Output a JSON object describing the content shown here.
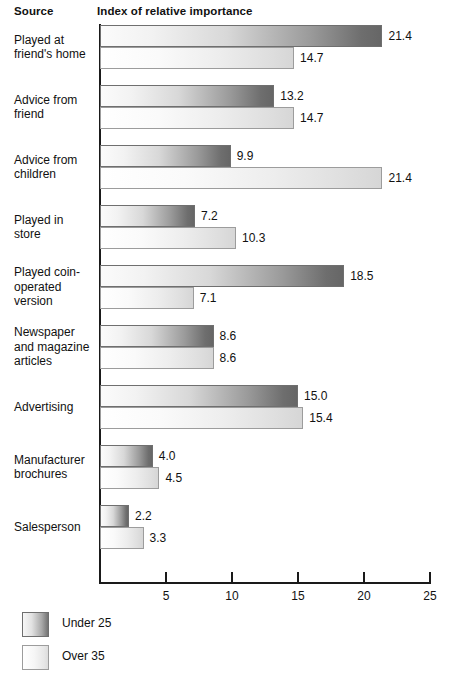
{
  "headers": {
    "source": "Source",
    "index": "Index of relative importance"
  },
  "axis": {
    "ticks": [
      {
        "value": 5,
        "label": "5"
      },
      {
        "value": 10,
        "label": "10"
      },
      {
        "value": 15,
        "label": "15"
      },
      {
        "value": 20,
        "label": "20"
      },
      {
        "value": 25,
        "label": "25"
      }
    ]
  },
  "legend": [
    {
      "name": "under25",
      "label": "Under 25"
    },
    {
      "name": "over35",
      "label": "Over 35"
    }
  ],
  "chart_data": {
    "type": "bar",
    "orientation": "horizontal",
    "title": "Index of relative importance",
    "xlabel": "",
    "ylabel": "Source",
    "xlim": [
      0,
      25
    ],
    "grid": false,
    "legend_position": "bottom-left",
    "categories": [
      "Played at friend's home",
      "Advice from friend",
      "Advice from children",
      "Played in store",
      "Played coin-operated version",
      "Newspaper and magazine articles",
      "Advertising",
      "Manufacturer brochures",
      "Salesperson"
    ],
    "category_lines": [
      [
        "Played at",
        "friend's home"
      ],
      [
        "Advice from",
        "friend"
      ],
      [
        "Advice from",
        "children"
      ],
      [
        "Played in",
        "store"
      ],
      [
        "Played coin-",
        "operated",
        "version"
      ],
      [
        "Newspaper",
        "and magazine",
        "articles"
      ],
      [
        "Advertising"
      ],
      [
        "Manufacturer",
        "brochures"
      ],
      [
        "Salesperson"
      ]
    ],
    "series": [
      {
        "name": "Under 25",
        "key": "under25",
        "values": [
          21.4,
          13.2,
          9.9,
          7.2,
          18.5,
          8.6,
          15.0,
          4.0,
          2.2
        ],
        "labels": [
          "21.4",
          "13.2",
          "9.9",
          "7.2",
          "18.5",
          "8.6",
          "15.0",
          "4.0",
          "2.2"
        ]
      },
      {
        "name": "Over 35",
        "key": "over35",
        "values": [
          14.7,
          14.7,
          21.4,
          10.3,
          7.1,
          8.6,
          15.4,
          4.5,
          3.3
        ],
        "labels": [
          "14.7",
          "14.7",
          "21.4",
          "10.3",
          "7.1",
          "8.6",
          "15.4",
          "4.5",
          "3.3"
        ]
      }
    ]
  }
}
